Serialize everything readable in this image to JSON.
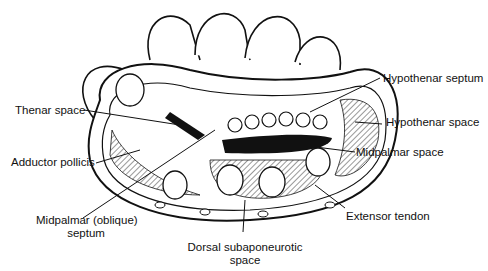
{
  "figure": {
    "labels": {
      "thenar_space": "Thenar space",
      "adductor_pollicis": "Adductor pollicis",
      "midpalmar_oblique_septum_line1": "Midpalmar (oblique)",
      "midpalmar_oblique_septum_line2": "septum",
      "dorsal_subaponeurotic_line1": "Dorsal subaponeurotic",
      "dorsal_subaponeurotic_line2": "space",
      "extensor_tendon": "Extensor tendon",
      "midpalmar_space": "Midpalmar space",
      "hypothenar_space": "Hypothenar space",
      "hypothenar_septum": "Hypothenar septum"
    }
  }
}
